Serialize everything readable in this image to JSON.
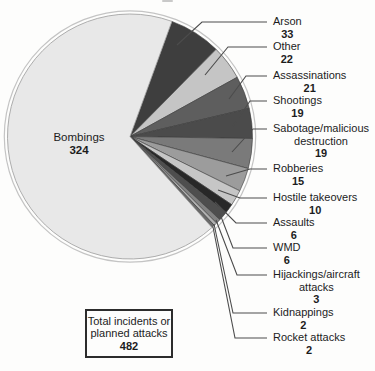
{
  "chart_data": {
    "type": "pie",
    "title": "",
    "direction": "clockwise",
    "start_angle_deg": 20,
    "legend_position": "right-callouts",
    "total": {
      "label": "Total incidents or\nplanned attacks",
      "value": 482
    },
    "slices": [
      {
        "label": "Arson",
        "value": 33,
        "color": "#3e3e3e"
      },
      {
        "label": "Other",
        "value": 22,
        "color": "#c5c5c5"
      },
      {
        "label": "Assassinations",
        "value": 21,
        "color": "#5e5e5e"
      },
      {
        "label": "Shootings",
        "value": 19,
        "color": "#4b4b4b"
      },
      {
        "label": "Sabotage/malicious\ndestruction",
        "value": 19,
        "color": "#7a7a7a"
      },
      {
        "label": "Robberies",
        "value": 15,
        "color": "#9c9c9c"
      },
      {
        "label": "Hostile takeovers",
        "value": 10,
        "color": "#c6c6c6"
      },
      {
        "label": "Assaults",
        "value": 6,
        "color": "#282828"
      },
      {
        "label": "WMD",
        "value": 6,
        "color": "#4e4e4e"
      },
      {
        "label": "Hijackings/aircraft\nattacks",
        "value": 3,
        "color": "#828282"
      },
      {
        "label": "Kidnappings",
        "value": 2,
        "color": "#b0b0b0"
      },
      {
        "label": "Rocket attacks",
        "value": 2,
        "color": "#6a6a6a"
      },
      {
        "label": "Bombings",
        "value": 324,
        "color": "#e8e8e8"
      }
    ],
    "colors": {
      "leader_line": "#4c4c4c",
      "wedge_outline": "#3a3a3a",
      "outer_ring": "#c4c4c4",
      "text": "#1c1c1c"
    }
  }
}
